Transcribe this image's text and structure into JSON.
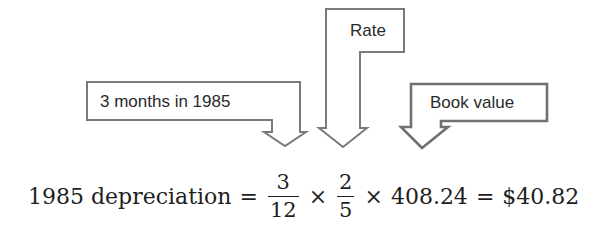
{
  "callouts": [
    {
      "id": "months",
      "label": "3 months in 1985",
      "points_to": "3/12"
    },
    {
      "id": "rate",
      "label": "Rate",
      "points_to": "2/5"
    },
    {
      "id": "book_value",
      "label": "Book value",
      "points_to": "408.24"
    }
  ],
  "equation": {
    "lhs": "1985 depreciation",
    "equals": "=",
    "fraction1": {
      "numerator": "3",
      "denominator": "12"
    },
    "times1": "×",
    "fraction2": {
      "numerator": "2",
      "denominator": "5"
    },
    "times2": "×",
    "book_value": "408.24",
    "equals2": "=",
    "result": "$40.82"
  },
  "colors": {
    "callout_stroke": "#777777",
    "text": "#1e1e1e",
    "background": "#ffffff"
  }
}
